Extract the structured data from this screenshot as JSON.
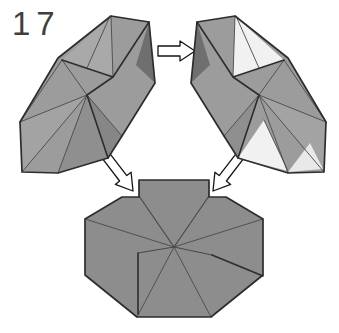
{
  "step_label": "17",
  "colors": {
    "background": "#ffffff",
    "label-color": "#3f3f3f",
    "outline": "#2d2d2d",
    "crease": "#4a4a4a",
    "unit-gray": "#9c9c9c",
    "unit-gray-light": "#a9a9a9",
    "unit-gray-2": "#a3a3a3",
    "unit-gray-3": "#8f8f8f",
    "unit-gray-4": "#868686",
    "unit-dark": "#6f6f6f",
    "unit-white": "#f1f1f1",
    "unit-white-2": "#e9e9e9",
    "octagon-gray": "#8d8d8d",
    "arrow-fill": "#ffffff",
    "arrow-outline": "#151515"
  },
  "icons": {
    "transform-arrow": "hollow right arrow",
    "insert-arrow-left": "hollow arrow pointing down-right into left notch",
    "insert-arrow-right": "hollow arrow pointing down-left into right notch"
  }
}
